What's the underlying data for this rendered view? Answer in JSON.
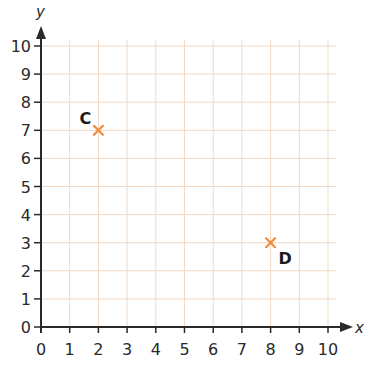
{
  "chart_data": {
    "type": "scatter",
    "title": "",
    "xlabel": "x",
    "ylabel": "y",
    "xlim": [
      0,
      10
    ],
    "ylim": [
      0,
      10
    ],
    "grid": true,
    "x_ticks": [
      0,
      1,
      2,
      3,
      4,
      5,
      6,
      7,
      8,
      9,
      10
    ],
    "y_ticks": [
      0,
      1,
      2,
      3,
      4,
      5,
      6,
      7,
      8,
      9,
      10
    ],
    "tick_labels_x": [
      "0",
      "1",
      "2",
      "3",
      "4",
      "5",
      "6",
      "7",
      "8",
      "9",
      "10"
    ],
    "tick_labels_y": [
      "0",
      "1",
      "2",
      "3",
      "4",
      "5",
      "6",
      "7",
      "8",
      "9",
      "10"
    ],
    "points": [
      {
        "label": "C",
        "x": 2,
        "y": 7,
        "label_position": "upper-left"
      },
      {
        "label": "D",
        "x": 8,
        "y": 3,
        "label_position": "lower-right"
      }
    ],
    "marker": "x",
    "legend": null
  },
  "colors": {
    "grid": "#f3d9c4",
    "axis": "#2a2a2a",
    "marker": "#ef8a3e",
    "text": "#2a2a2a"
  }
}
